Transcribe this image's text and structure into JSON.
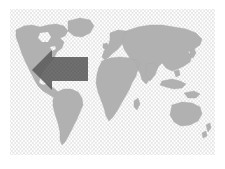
{
  "image": {
    "kind": "world-map-illustration",
    "width": 225,
    "height": 169,
    "background_color": "#ffffff",
    "alt_text": "Grey silhouette world map on a fine diamond lattice background with a large dark left-pointing arrow over the Atlantic"
  },
  "map_panel": {
    "x": 10,
    "y": 9,
    "width": 205,
    "height": 146,
    "pattern": {
      "name": "diamond-lattice-hatch",
      "line_color": "#d7d7d7",
      "fill_color": "#ffffff",
      "cell_width": 7,
      "cell_height": 4
    },
    "land_color": "#a9a9a9",
    "land_edge_color": "#9c9c9c"
  },
  "continents": [
    {
      "name": "greenland",
      "label": "Greenland"
    },
    {
      "name": "north-america",
      "label": "North America"
    },
    {
      "name": "south-america",
      "label": "South America"
    },
    {
      "name": "europe",
      "label": "Europe"
    },
    {
      "name": "africa",
      "label": "Africa"
    },
    {
      "name": "asia",
      "label": "Asia"
    },
    {
      "name": "australia",
      "label": "Australia"
    },
    {
      "name": "new-zealand",
      "label": "New Zealand"
    },
    {
      "name": "japan",
      "label": "Japan"
    },
    {
      "name": "madagascar",
      "label": "Madagascar"
    },
    {
      "name": "british-isles",
      "label": "British Isles"
    },
    {
      "name": "indonesia",
      "label": "Indonesia"
    }
  ],
  "arrow": {
    "name": "left-arrow-overlay",
    "direction": "left",
    "color": "#252525",
    "opacity": 0.88,
    "tip_x": 22,
    "tip_y": 61,
    "head_top_y": 41,
    "head_bottom_y": 81,
    "shaft_start_x": 42,
    "shaft_end_x": 78,
    "shaft_top_y": 48,
    "shaft_bottom_y": 72
  }
}
